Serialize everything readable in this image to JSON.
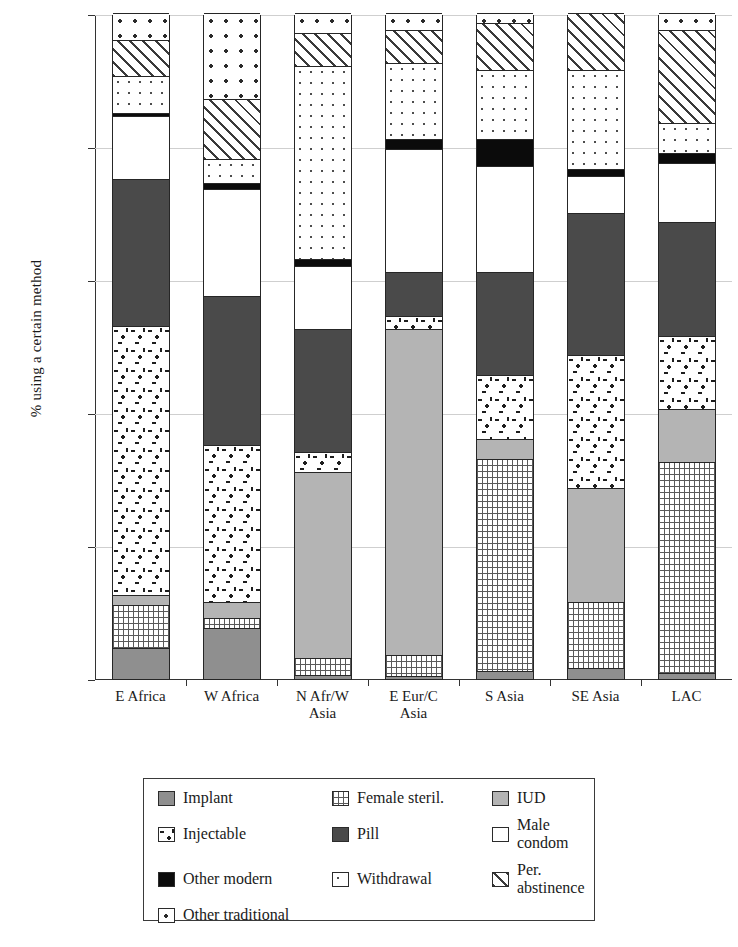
{
  "chart_data": {
    "type": "bar",
    "subtype": "stacked-100-percent",
    "title": "",
    "xlabel": "",
    "ylabel": "% using a certain method",
    "ylim": [
      0,
      100
    ],
    "yticks": [
      0,
      20,
      40,
      60,
      80,
      100
    ],
    "grid": true,
    "legend_position": "bottom",
    "categories": [
      "E Africa",
      "W Africa",
      "N Afr/W\nAsia",
      "E Eur/C\nAsia",
      "S Asia",
      "SE Asia",
      "LAC"
    ],
    "series": [
      {
        "name": "Implant",
        "key": "implant",
        "values": [
          4.5,
          7.5,
          0.5,
          0.3,
          1.0,
          1.5,
          0.8
        ]
      },
      {
        "name": "Female steril.",
        "key": "femsteril",
        "values": [
          6.5,
          1.5,
          2.5,
          3.2,
          32.0,
          10.0,
          31.7
        ]
      },
      {
        "name": "IUD",
        "key": "iud",
        "values": [
          1.5,
          2.5,
          28.0,
          49.0,
          3.0,
          17.0,
          8.0
        ]
      },
      {
        "name": "Injectable",
        "key": "injectable",
        "values": [
          40.5,
          23.5,
          3.0,
          2.0,
          9.5,
          20.0,
          11.0
        ]
      },
      {
        "name": "Pill",
        "key": "pill",
        "values": [
          22.0,
          22.5,
          18.5,
          6.5,
          15.5,
          21.5,
          17.0
        ]
      },
      {
        "name": "Male condom",
        "key": "condom",
        "values": [
          9.5,
          16.0,
          9.5,
          18.5,
          16.0,
          5.5,
          9.0
        ]
      },
      {
        "name": "Other modern",
        "key": "othermodern",
        "values": [
          0.5,
          1.0,
          1.0,
          1.5,
          4.0,
          1.0,
          1.5
        ]
      },
      {
        "name": "Withdrawal",
        "key": "withdrawal",
        "values": [
          5.5,
          3.5,
          29.0,
          11.5,
          10.5,
          15.0,
          4.5
        ]
      },
      {
        "name": "Per. abstinence",
        "key": "perabst",
        "values": [
          5.5,
          9.0,
          5.0,
          5.0,
          7.0,
          8.5,
          14.0
        ]
      },
      {
        "name": "Other traditional",
        "key": "othertrad",
        "values": [
          4.0,
          13.0,
          3.0,
          2.5,
          1.5,
          0.0,
          2.5
        ]
      }
    ]
  },
  "axis": {
    "y_label": "% using a certain method",
    "y_ticks": [
      "100",
      "80",
      "60",
      "40",
      "20",
      "0"
    ]
  },
  "legend": {
    "items": [
      {
        "label": "Implant",
        "pattern": "p-implant"
      },
      {
        "label": "Female steril.",
        "pattern": "p-femsteril"
      },
      {
        "label": "IUD",
        "pattern": "p-iud"
      },
      {
        "label": "Injectable",
        "pattern": "p-injectable"
      },
      {
        "label": "Pill",
        "pattern": "p-pill"
      },
      {
        "label": "Male condom",
        "pattern": "p-condom"
      },
      {
        "label": "Other modern",
        "pattern": "p-othermodern"
      },
      {
        "label": "Withdrawal",
        "pattern": "p-withdrawal"
      },
      {
        "label": "Per. abstinence",
        "pattern": "p-perabst"
      },
      {
        "label": "Other traditional",
        "pattern": "p-othertrad"
      }
    ]
  }
}
